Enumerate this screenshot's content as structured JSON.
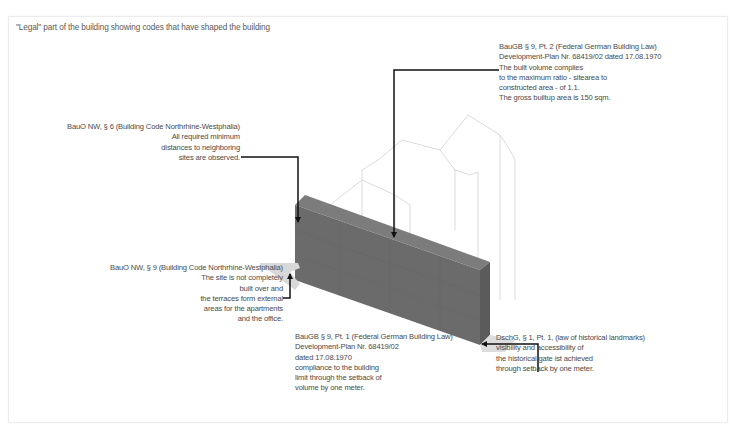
{
  "caption": "\"Legal\" part of the building showing codes that have shaped the building",
  "annotations": {
    "baugb_pt2": {
      "lines": [
        "BauGB § 9, Pt. 2 (Federal German Building Law)",
        "Development-Plan Nr. 68419/02 dated 17.08.1970",
        "The built volume complies",
        "to the maximum ratio - sitearea to",
        "constructed area - of 1.1.",
        "The gross builtup area is 150 sqm."
      ]
    },
    "bauo_par6": {
      "lines": [
        "BauO NW, § 6 (Building Code Northrhine-Westphalia)",
        "All required minimum",
        "distances to neighboring",
        "sites are observed."
      ]
    },
    "bauo_par9": {
      "lines": [
        "BauO NW, § 9 (Building Code Northrhine-Westphalia)",
        "The site is not completely",
        "built over and",
        "the terraces form external",
        "areas for the apartments",
        "and the office."
      ]
    },
    "baugb_pt1": {
      "lines": [
        "BauGB § 9, Pt. 1 (Federal German Building Law)",
        "Development-Plan Nr. 68419/02",
        "dated 17.08.1970",
        "compliance to the building",
        "limit through the setback of",
        "volume by one meter."
      ]
    },
    "dschg": {
      "lines": [
        "DschG, § 1, Pt. 1, (law of historical landmarks)",
        "visibility and accessibility of",
        "the historical gate ist achieved",
        "through setback by one meter."
      ]
    }
  },
  "colors": {
    "volume_front": "#6a6a6a",
    "volume_top": "#7a7a7a",
    "volume_side": "#5e5e5e",
    "terrace": "#d9d9d9",
    "ghost_outline": "#d0d0d0",
    "leader": "#111111",
    "text": "#4a4a4a"
  }
}
